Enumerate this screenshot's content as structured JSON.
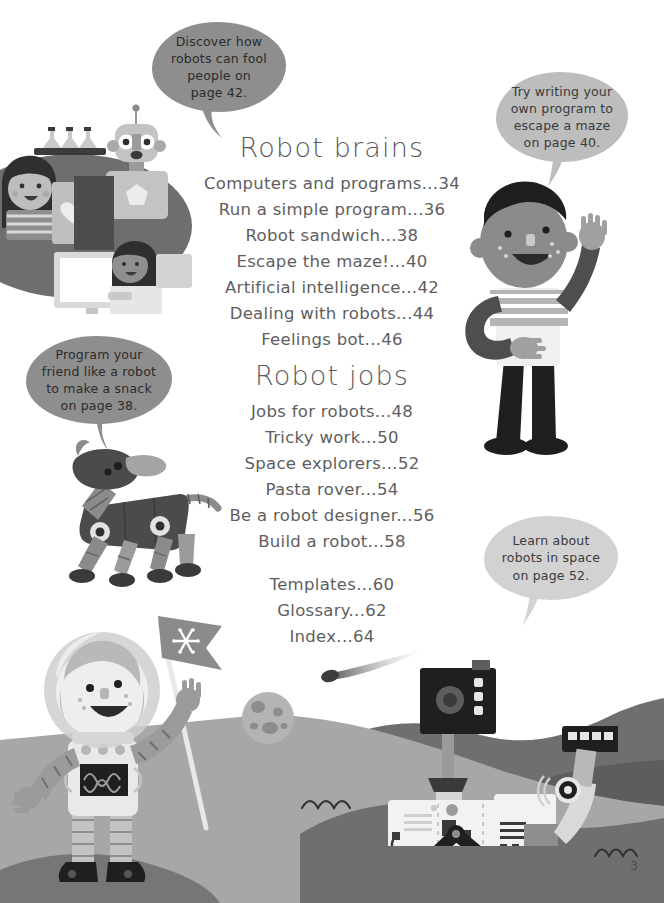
{
  "page": {
    "page_number": "3",
    "background_color": "#ffffff",
    "text_color": "#5e5e60"
  },
  "bubbles": [
    {
      "id": "bubble-discover",
      "name": "speech-bubble-discover",
      "lines": [
        "Discover how",
        "robots can fool",
        "people on",
        "page 42."
      ],
      "color": "#8e8e8e",
      "tone": "dark"
    },
    {
      "id": "bubble-maze",
      "name": "speech-bubble-maze",
      "lines": [
        "Try writing your",
        "own program to",
        "escape a maze",
        "on page 40."
      ],
      "color": "#bdbdbd",
      "tone": "light"
    },
    {
      "id": "bubble-snack",
      "name": "speech-bubble-snack",
      "lines": [
        "Program your",
        "friend like a robot",
        "to make a snack",
        "on page 38."
      ],
      "color": "#8e8e8e",
      "tone": "dark"
    },
    {
      "id": "bubble-space",
      "name": "speech-bubble-space",
      "lines": [
        "Learn about",
        "robots in space",
        "on page 52."
      ],
      "color": "#d2d2d2",
      "tone": "light"
    }
  ],
  "sections": [
    {
      "heading": "Robot brains",
      "entries": [
        {
          "title": "Computers and programs",
          "page": "34"
        },
        {
          "title": "Run a simple program",
          "page": "36"
        },
        {
          "title": "Robot sandwich",
          "page": "38"
        },
        {
          "title": "Escape the maze!",
          "page": "40"
        },
        {
          "title": "Artificial intelligence",
          "page": "42"
        },
        {
          "title": "Dealing with robots",
          "page": "44"
        },
        {
          "title": "Feelings bot",
          "page": "46"
        }
      ]
    },
    {
      "heading": "Robot jobs",
      "entries": [
        {
          "title": "Jobs for robots",
          "page": "48"
        },
        {
          "title": "Tricky work",
          "page": "50"
        },
        {
          "title": "Space explorers",
          "page": "52"
        },
        {
          "title": "Pasta rover",
          "page": "54"
        },
        {
          "title": "Be a robot designer",
          "page": "56"
        },
        {
          "title": "Build a robot",
          "page": "58"
        }
      ]
    },
    {
      "heading": "",
      "entries": [
        {
          "title": "Templates",
          "page": "60"
        },
        {
          "title": "Glossary",
          "page": "62"
        },
        {
          "title": "Index",
          "page": "64"
        }
      ]
    }
  ],
  "illustrations": [
    {
      "name": "lab-scene-illustration",
      "description": "Children and robot at a computer workstation with flasks on a shelf"
    },
    {
      "name": "waving-boy-illustration",
      "description": "Boy in striped shirt and apron waving"
    },
    {
      "name": "robot-dog-illustration",
      "description": "Mechanical robotic dog"
    },
    {
      "name": "astronaut-illustration",
      "description": "Child astronaut holding a flag"
    },
    {
      "name": "mars-rover-illustration",
      "description": "Six-wheeled rover with camera mast and robotic arm"
    },
    {
      "name": "moon-illustration",
      "description": "Cratered grey moon"
    },
    {
      "name": "comet-illustration",
      "description": "Comet with streaking tail"
    }
  ]
}
